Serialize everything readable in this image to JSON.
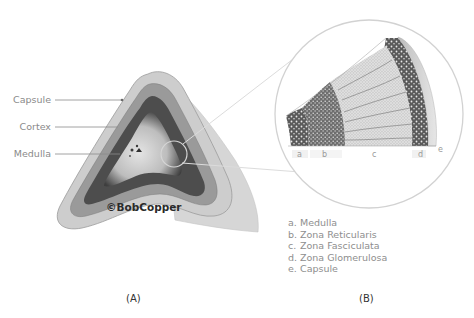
{
  "panel_a": {
    "label": "(A)",
    "watermark": "©BobCopper",
    "callouts": [
      {
        "label": "Capsule"
      },
      {
        "label": "Cortex"
      },
      {
        "label": "Medulla"
      }
    ]
  },
  "panel_b": {
    "label": "(B)",
    "zone_letters": [
      "a",
      "b",
      "c",
      "d",
      "e"
    ],
    "legend": [
      {
        "letter": "a.",
        "text": "Medulla"
      },
      {
        "letter": "b.",
        "text": "Zona Reticularis"
      },
      {
        "letter": "c.",
        "text": "Zona Fasciculata"
      },
      {
        "letter": "d.",
        "text": "Zona Glomerulosa"
      },
      {
        "letter": "e.",
        "text": "Capsule"
      }
    ]
  },
  "colors": {
    "capsule": "#c9c9c9",
    "cortex_dark": "#4a4a4a",
    "medulla": "#d8d8d8",
    "zoom_circle": "#cfcfcf",
    "label_text": "#8a8a8a"
  }
}
